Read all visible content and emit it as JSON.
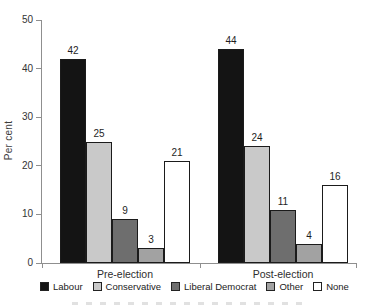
{
  "chart_data": {
    "type": "bar",
    "title": "",
    "ylabel": "Per cent",
    "xlabel": "",
    "ylim": [
      0,
      50
    ],
    "yticks": [
      0,
      10,
      20,
      30,
      40,
      50
    ],
    "grid": false,
    "legend_position": "bottom",
    "categories": [
      "Pre-election",
      "Post-election"
    ],
    "series": [
      {
        "name": "Labour",
        "color": "#141414",
        "values": [
          42,
          44
        ]
      },
      {
        "name": "Conservative",
        "color": "#c9c9c9",
        "values": [
          25,
          24
        ]
      },
      {
        "name": "Liberal Democrat",
        "color": "#6e6e6e",
        "values": [
          9,
          11
        ]
      },
      {
        "name": "Other",
        "color": "#a2a2a2",
        "values": [
          3,
          4
        ]
      },
      {
        "name": "None",
        "color": "#ffffff",
        "values": [
          21,
          16
        ]
      }
    ],
    "axis_color": "#8f8f8f",
    "bar_border_color": "#1b1b1b"
  }
}
